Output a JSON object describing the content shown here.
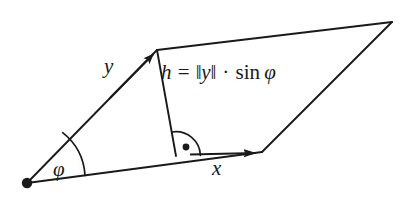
{
  "figure": {
    "background_color": "#ffffff",
    "stroke_color": "#1a1a1a",
    "width": 409,
    "height": 199
  },
  "labels": {
    "vector_y": "y",
    "vector_x": "x",
    "angle_phi": "φ",
    "height_formula": {
      "full_text": "h = ‖y‖ · sin φ",
      "h": "h",
      "equals": "=",
      "norm_open": "‖",
      "y": "y",
      "norm_close": "‖",
      "dot": "·",
      "sin": "sin",
      "phi": "φ"
    }
  },
  "geometry": {
    "origin_vertex": {
      "x": 27,
      "y": 183,
      "marker": "filled-dot"
    },
    "top_left_vertex": {
      "x": 157,
      "y": 50
    },
    "top_right_vertex": {
      "x": 392,
      "y": 22
    },
    "bottom_right_vertex": {
      "x": 262,
      "y": 152
    },
    "height_foot": {
      "x": 176,
      "y": 156
    },
    "edges": [
      {
        "name": "base-x-edge",
        "from": "origin_vertex",
        "to": "bottom_right_vertex",
        "arrow": true
      },
      {
        "name": "side-y-edge",
        "from": "origin_vertex",
        "to": "top_left_vertex",
        "arrow": true
      },
      {
        "name": "top-edge",
        "from": "top_left_vertex",
        "to": "top_right_vertex",
        "arrow": false
      },
      {
        "name": "right-edge",
        "from": "top_right_vertex",
        "to": "bottom_right_vertex",
        "arrow": false
      },
      {
        "name": "height-segment",
        "from": "top_left_vertex",
        "to": "height_foot",
        "arrow": false
      }
    ],
    "angle_marks": [
      {
        "name": "phi-arc",
        "at": "origin_vertex",
        "type": "arc"
      },
      {
        "name": "right-angle-arc",
        "at": "height_foot",
        "type": "quarter-arc-with-dot"
      }
    ]
  }
}
